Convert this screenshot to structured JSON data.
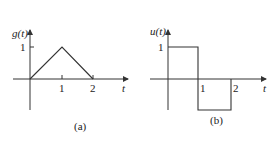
{
  "figures": [
    {
      "id": "a",
      "caption": "(a)",
      "ylabel": "g(t)",
      "xlabel": "t",
      "ytick": "1",
      "xticks": [
        "1",
        "2"
      ],
      "shape": "triangle",
      "points": [
        [
          0,
          0
        ],
        [
          1,
          1
        ],
        [
          2,
          0
        ]
      ]
    },
    {
      "id": "b",
      "caption": "(b)",
      "ylabel": "u(t)",
      "xlabel": "t",
      "ytick": "1",
      "xticks": [
        "1",
        "2"
      ],
      "shape": "square-pulse",
      "points": [
        [
          0,
          1
        ],
        [
          1,
          1
        ],
        [
          1,
          -1
        ],
        [
          2,
          -1
        ],
        [
          2,
          0
        ]
      ]
    }
  ],
  "colors": {
    "line": "#333333",
    "axis": "#333333"
  }
}
